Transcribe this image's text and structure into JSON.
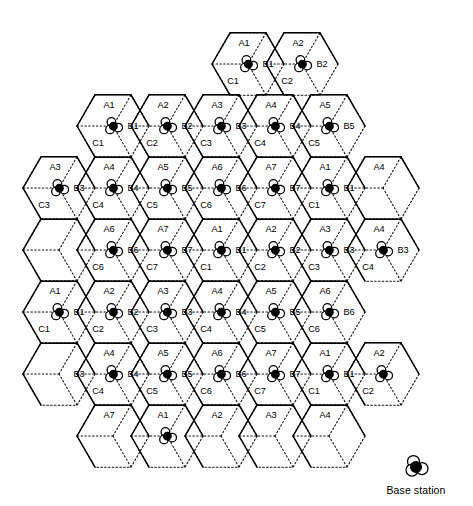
{
  "figure": {
    "type": "cellular-frequency-reuse-diagram",
    "title": "",
    "cluster_size": 7,
    "sectors_per_cell": 3,
    "sector_names": [
      "A",
      "B",
      "C"
    ],
    "cell_numbers": [
      1,
      2,
      3,
      4,
      5,
      6,
      7
    ],
    "colors": {
      "ink": "#000000",
      "background": "#ffffff",
      "cell_boundary": "#111111",
      "cluster_boundary": "#000000"
    }
  },
  "legend": {
    "label": "Base station",
    "icon": "base-station-icon"
  },
  "geometry": {
    "hex_radius": 36,
    "col_step": 54,
    "row_step": 62,
    "origin_x": 86,
    "origin_y": 64
  },
  "cells": [
    {
      "id": "r0c3",
      "col": 3,
      "row": 0,
      "cx": 248,
      "cy": 64,
      "n": 1,
      "bs": true,
      "labels": {
        "A": "A1",
        "B": "B1",
        "C": "C1"
      }
    },
    {
      "id": "r0c4",
      "col": 4,
      "row": 0,
      "cx": 302,
      "cy": 64,
      "n": 2,
      "bs": true,
      "labels": {
        "A": "A2",
        "B": "B2",
        "C": "C2"
      }
    },
    {
      "id": "r1c1",
      "col": 1,
      "row": 1,
      "cx": 113,
      "cy": 126,
      "n": 1,
      "bs": true,
      "labels": {
        "A": "A1",
        "B": "B1",
        "C": "C1"
      }
    },
    {
      "id": "r1c2",
      "col": 2,
      "row": 1,
      "cx": 167,
      "cy": 126,
      "n": 2,
      "bs": true,
      "labels": {
        "A": "A2",
        "B": "B2",
        "C": "C2"
      }
    },
    {
      "id": "r1c3",
      "col": 3,
      "row": 1,
      "cx": 221,
      "cy": 126,
      "n": 3,
      "bs": true,
      "labels": {
        "A": "A3",
        "B": "B3",
        "C": "C3"
      }
    },
    {
      "id": "r1c4",
      "col": 4,
      "row": 1,
      "cx": 275,
      "cy": 126,
      "n": 4,
      "bs": true,
      "labels": {
        "A": "A4",
        "B": "B4",
        "C": "C4"
      }
    },
    {
      "id": "r1c5",
      "col": 5,
      "row": 1,
      "cx": 329,
      "cy": 126,
      "n": 5,
      "bs": true,
      "labels": {
        "A": "A5",
        "B": "B5",
        "C": "C5"
      }
    },
    {
      "id": "r2c0",
      "col": 0,
      "row": 2,
      "cx": 59,
      "cy": 188,
      "n": 3,
      "bs": true,
      "labels": {
        "A": "A3",
        "B": "B3",
        "C": "C3"
      }
    },
    {
      "id": "r2c1",
      "col": 1,
      "row": 2,
      "cx": 113,
      "cy": 188,
      "n": 4,
      "bs": true,
      "labels": {
        "A": "A4",
        "B": "B4",
        "C": "C4"
      }
    },
    {
      "id": "r2c2",
      "col": 2,
      "row": 2,
      "cx": 167,
      "cy": 188,
      "n": 5,
      "bs": true,
      "labels": {
        "A": "A5",
        "B": "B5",
        "C": "C5"
      }
    },
    {
      "id": "r2c3",
      "col": 3,
      "row": 2,
      "cx": 221,
      "cy": 188,
      "n": 6,
      "bs": true,
      "labels": {
        "A": "A6",
        "B": "B6",
        "C": "C6"
      }
    },
    {
      "id": "r2c4",
      "col": 4,
      "row": 2,
      "cx": 275,
      "cy": 188,
      "n": 7,
      "bs": true,
      "labels": {
        "A": "A7",
        "B": "B7",
        "C": "C7"
      }
    },
    {
      "id": "r2c5",
      "col": 5,
      "row": 2,
      "cx": 329,
      "cy": 188,
      "n": 1,
      "bs": true,
      "labels": {
        "A": "A1",
        "B": "B1",
        "C": "C1"
      }
    },
    {
      "id": "r2c6",
      "col": 6,
      "row": 2,
      "cx": 383,
      "cy": 188,
      "n": 4,
      "bs": false,
      "labels": {
        "A": "A4",
        "B": "",
        "C": ""
      }
    },
    {
      "id": "r3c0",
      "col": 0,
      "row": 3,
      "cx": 59,
      "cy": 250,
      "n": 0,
      "bs": false,
      "labels": {
        "A": "",
        "B": "",
        "C": ""
      }
    },
    {
      "id": "r3c1",
      "col": 1,
      "row": 3,
      "cx": 113,
      "cy": 250,
      "n": 6,
      "bs": true,
      "labels": {
        "A": "A6",
        "B": "B6",
        "C": "C6"
      }
    },
    {
      "id": "r3c2",
      "col": 2,
      "row": 3,
      "cx": 167,
      "cy": 250,
      "n": 7,
      "bs": true,
      "labels": {
        "A": "A7",
        "B": "B7",
        "C": "C7"
      }
    },
    {
      "id": "r3c3",
      "col": 3,
      "row": 3,
      "cx": 221,
      "cy": 250,
      "n": 1,
      "bs": true,
      "labels": {
        "A": "A1",
        "B": "B1",
        "C": "C1"
      }
    },
    {
      "id": "r3c4",
      "col": 4,
      "row": 3,
      "cx": 275,
      "cy": 250,
      "n": 2,
      "bs": true,
      "labels": {
        "A": "A2",
        "B": "B2",
        "C": "C2"
      }
    },
    {
      "id": "r3c5",
      "col": 5,
      "row": 3,
      "cx": 329,
      "cy": 250,
      "n": 3,
      "bs": true,
      "labels": {
        "A": "A3",
        "B": "B3",
        "C": "C3"
      }
    },
    {
      "id": "r3c6",
      "col": 6,
      "row": 3,
      "cx": 383,
      "cy": 250,
      "n": 4,
      "bs": true,
      "labels": {
        "A": "A4",
        "B": "B3",
        "C": "C4"
      }
    },
    {
      "id": "r4c0",
      "col": 0,
      "row": 4,
      "cx": 59,
      "cy": 312,
      "n": 1,
      "bs": true,
      "labels": {
        "A": "A1",
        "B": "B1",
        "C": "C1"
      }
    },
    {
      "id": "r4c1",
      "col": 1,
      "row": 4,
      "cx": 113,
      "cy": 312,
      "n": 2,
      "bs": true,
      "labels": {
        "A": "A2",
        "B": "B2",
        "C": "C2"
      }
    },
    {
      "id": "r4c2",
      "col": 2,
      "row": 4,
      "cx": 167,
      "cy": 312,
      "n": 3,
      "bs": true,
      "labels": {
        "A": "A3",
        "B": "B3",
        "C": "C3"
      }
    },
    {
      "id": "r4c3",
      "col": 3,
      "row": 4,
      "cx": 221,
      "cy": 312,
      "n": 4,
      "bs": true,
      "labels": {
        "A": "A4",
        "B": "B4",
        "C": "C4"
      }
    },
    {
      "id": "r4c4",
      "col": 4,
      "row": 4,
      "cx": 275,
      "cy": 312,
      "n": 5,
      "bs": true,
      "labels": {
        "A": "A5",
        "B": "B5",
        "C": "C5"
      }
    },
    {
      "id": "r4c5",
      "col": 5,
      "row": 4,
      "cx": 329,
      "cy": 312,
      "n": 6,
      "bs": true,
      "labels": {
        "A": "A6",
        "B": "B6",
        "C": "C6"
      }
    },
    {
      "id": "r5c0",
      "col": 0,
      "row": 5,
      "cx": 59,
      "cy": 374,
      "n": 3,
      "bs": false,
      "labels": {
        "A": "",
        "B": "B3",
        "C": ""
      }
    },
    {
      "id": "r5c1",
      "col": 1,
      "row": 5,
      "cx": 113,
      "cy": 374,
      "n": 4,
      "bs": true,
      "labels": {
        "A": "A4",
        "B": "B4",
        "C": "C4"
      }
    },
    {
      "id": "r5c2",
      "col": 2,
      "row": 5,
      "cx": 167,
      "cy": 374,
      "n": 5,
      "bs": true,
      "labels": {
        "A": "A5",
        "B": "B5",
        "C": "C5"
      }
    },
    {
      "id": "r5c3",
      "col": 3,
      "row": 5,
      "cx": 221,
      "cy": 374,
      "n": 6,
      "bs": true,
      "labels": {
        "A": "A6",
        "B": "B6",
        "C": "C6"
      }
    },
    {
      "id": "r5c4",
      "col": 4,
      "row": 5,
      "cx": 275,
      "cy": 374,
      "n": 7,
      "bs": true,
      "labels": {
        "A": "A7",
        "B": "B7",
        "C": "C7"
      }
    },
    {
      "id": "r5c5",
      "col": 5,
      "row": 5,
      "cx": 329,
      "cy": 374,
      "n": 1,
      "bs": true,
      "labels": {
        "A": "A1",
        "B": "B1",
        "C": "C1"
      }
    },
    {
      "id": "r5c6",
      "col": 6,
      "row": 5,
      "cx": 383,
      "cy": 374,
      "n": 2,
      "bs": true,
      "labels": {
        "A": "A2",
        "B": "",
        "C": "C2"
      }
    },
    {
      "id": "r6c1",
      "col": 1,
      "row": 6,
      "cx": 113,
      "cy": 436,
      "n": 7,
      "bs": false,
      "labels": {
        "A": "A7",
        "B": "",
        "C": ""
      }
    },
    {
      "id": "r6c2",
      "col": 2,
      "row": 6,
      "cx": 167,
      "cy": 436,
      "n": 1,
      "bs": true,
      "labels": {
        "A": "A1",
        "B": "",
        "C": ""
      }
    },
    {
      "id": "r6c3",
      "col": 3,
      "row": 6,
      "cx": 221,
      "cy": 436,
      "n": 2,
      "bs": false,
      "labels": {
        "A": "A2",
        "B": "",
        "C": ""
      }
    },
    {
      "id": "r6c4",
      "col": 4,
      "row": 6,
      "cx": 275,
      "cy": 436,
      "n": 3,
      "bs": false,
      "labels": {
        "A": "A3",
        "B": "",
        "C": ""
      }
    },
    {
      "id": "r6c5",
      "col": 5,
      "row": 6,
      "cx": 329,
      "cy": 436,
      "n": 4,
      "bs": false,
      "labels": {
        "A": "A4",
        "B": "",
        "C": ""
      }
    }
  ],
  "clusters": [
    {
      "id": "cluster-top-right",
      "center_cell": "r1c4"
    },
    {
      "id": "cluster-upper-left",
      "center_cell": "r2c1"
    },
    {
      "id": "cluster-middle",
      "center_cell": "r3c3"
    },
    {
      "id": "cluster-right",
      "center_cell": "r3c6"
    },
    {
      "id": "cluster-lower-left",
      "center_cell": "r4c1"
    },
    {
      "id": "cluster-lower-middle",
      "center_cell": "r5c3"
    }
  ]
}
